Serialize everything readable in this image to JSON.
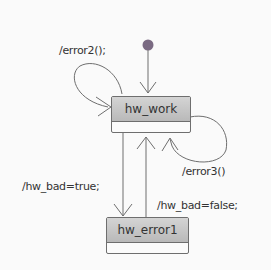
{
  "diagram": {
    "type": "state-machine",
    "initial_state": "hw_work",
    "states": [
      {
        "id": "hw_work",
        "label": "hw_work"
      },
      {
        "id": "hw_error1",
        "label": "hw_error1"
      }
    ],
    "transitions": [
      {
        "from": "initial",
        "to": "hw_work",
        "label": ""
      },
      {
        "from": "hw_work",
        "to": "hw_work",
        "label": "/error2();"
      },
      {
        "from": "hw_work",
        "to": "hw_work",
        "label": "/error3()"
      },
      {
        "from": "hw_work",
        "to": "hw_error1",
        "label": "/hw_bad=true;"
      },
      {
        "from": "hw_error1",
        "to": "hw_work",
        "label": "/hw_bad=false;"
      }
    ],
    "colors": {
      "state_fill": "#c6c6c6",
      "initial_dot": "#7a6a82",
      "lines": "#6e6e6e"
    }
  }
}
